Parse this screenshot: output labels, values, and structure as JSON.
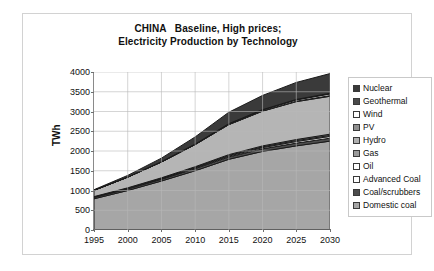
{
  "chart_data": {
    "type": "area",
    "stacked": true,
    "title": "CHINA   Baseline, High prices;\nElectricity Production by Technology",
    "title_lines": [
      "CHINA   Baseline, High prices;",
      "Electricity Production by Technology"
    ],
    "xlabel": "",
    "ylabel": "TWh",
    "xlim": [
      1995,
      2030
    ],
    "ylim": [
      0,
      4000
    ],
    "ytick_step": 500,
    "xtick_step": 5,
    "grid": true,
    "legend_position": "right",
    "x": [
      1995,
      2000,
      2005,
      2010,
      2015,
      2020,
      2025,
      2030
    ],
    "xticklabels": [
      "1995",
      "2000",
      "2005",
      "2010",
      "2015",
      "2020",
      "2025",
      "2030"
    ],
    "yticklabels": [
      "0",
      "500",
      "1000",
      "1500",
      "2000",
      "2500",
      "3000",
      "3500",
      "4000"
    ],
    "series": [
      {
        "name": "Domestic coal",
        "color": "#a6a6a6",
        "values": [
          790,
          1000,
          1240,
          1500,
          1790,
          1990,
          2130,
          2250
        ]
      },
      {
        "name": "Coal/scrubbers",
        "color": "#4d4d4d",
        "values": [
          35,
          40,
          45,
          55,
          60,
          65,
          70,
          75
        ]
      },
      {
        "name": "Advanced Coal",
        "color": "#ffffff",
        "values": [
          5,
          8,
          10,
          15,
          20,
          30,
          40,
          45
        ]
      },
      {
        "name": "Oil",
        "color": "#ffffff",
        "values": [
          10,
          12,
          14,
          16,
          18,
          20,
          22,
          24
        ]
      },
      {
        "name": "Gas",
        "color": "#9a9a9a",
        "values": [
          5,
          8,
          12,
          16,
          20,
          24,
          28,
          32
        ]
      },
      {
        "name": "Hydro",
        "color": "#b5b5b5",
        "values": [
          160,
          270,
          400,
          560,
          760,
          880,
          960,
          960
        ]
      },
      {
        "name": "PV",
        "color": "#8f8f8f",
        "values": [
          0,
          1,
          2,
          3,
          5,
          8,
          12,
          16
        ]
      },
      {
        "name": "Wind",
        "color": "#ffffff",
        "values": [
          0,
          2,
          4,
          8,
          14,
          22,
          32,
          42
        ]
      },
      {
        "name": "Geothermal",
        "color": "#3a3a3a",
        "values": [
          0,
          1,
          2,
          3,
          5,
          8,
          12,
          16
        ]
      },
      {
        "name": "Nuclear",
        "color": "#3a3a3a",
        "values": [
          15,
          40,
          90,
          180,
          290,
          360,
          430,
          500
        ]
      }
    ],
    "legend_entries": [
      {
        "label": "Nuclear",
        "color": "#3a3a3a"
      },
      {
        "label": "Geothermal",
        "color": "#4a4a4a"
      },
      {
        "label": "Wind",
        "color": "#ffffff"
      },
      {
        "label": "PV",
        "color": "#8f8f8f"
      },
      {
        "label": "Hydro",
        "color": "#b0b0b0"
      },
      {
        "label": "Gas",
        "color": "#9a9a9a"
      },
      {
        "label": "Oil",
        "color": "#ffffff"
      },
      {
        "label": "Advanced Coal",
        "color": "#ffffff"
      },
      {
        "label": "Coal/scrubbers",
        "color": "#4d4d4d"
      },
      {
        "label": "Domestic coal",
        "color": "#a6a6a6"
      }
    ],
    "totals": [
      1020,
      1382,
      1819,
      2356,
      2982,
      3407,
      3736,
      3960
    ]
  }
}
